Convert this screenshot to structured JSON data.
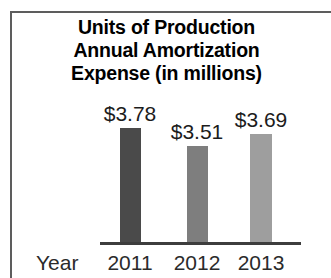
{
  "chart_data": {
    "type": "bar",
    "title": "Units of Production Annual Amortization Expense (in millions)",
    "title_lines": [
      "Units of Production",
      "Annual Amortization",
      "Expense (in millions)"
    ],
    "categories": [
      "2011",
      "2012",
      "2013"
    ],
    "values": [
      3.78,
      3.51,
      3.69
    ],
    "value_labels": [
      "$3.78",
      "$3.51",
      "$3.69"
    ],
    "xlabel": "Year",
    "ylabel": "",
    "ylim": [
      0,
      4.2
    ],
    "grid": false,
    "legend": false,
    "axis_visible": {
      "x": true,
      "y": false
    },
    "bar_colors": [
      "#4a4a4a",
      "#7e7e7e",
      "#9e9e9e"
    ],
    "currency": "$",
    "units": "millions"
  },
  "frame": {
    "border_color": "#5d5d5d"
  }
}
